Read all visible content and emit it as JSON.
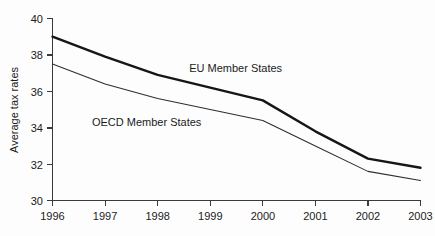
{
  "chart_data": {
    "type": "line",
    "title": "",
    "subtitle": "",
    "xlabel": "",
    "ylabel": "Average tax rates",
    "x": [
      1996,
      1997,
      1998,
      1999,
      2000,
      2001,
      2002,
      2003
    ],
    "x_ticklabels": [
      "1996",
      "1997",
      "1998",
      "1999",
      "2000",
      "2001",
      "2002",
      "2003"
    ],
    "y_ticklabels": [
      "30",
      "32",
      "34",
      "36",
      "38",
      "40"
    ],
    "y_ticks": [
      30,
      32,
      34,
      36,
      38,
      40
    ],
    "xlim": [
      1996,
      2003
    ],
    "ylim": [
      30,
      40
    ],
    "grid": false,
    "legend_position": "inline-annotations",
    "series": [
      {
        "name": "EU Member States",
        "label": "EU Member States",
        "color": "#161616",
        "line_width": "thick",
        "values": [
          39.0,
          37.9,
          36.9,
          36.2,
          35.5,
          33.8,
          32.3,
          31.8
        ],
        "label_x": 1998.6,
        "label_y": 37.05
      },
      {
        "name": "OECD Member States",
        "label": "OECD Member States",
        "color": "#2e2e2e",
        "line_width": "thin",
        "values": [
          37.5,
          36.4,
          35.6,
          35.0,
          34.4,
          33.0,
          31.6,
          31.1
        ],
        "label_x": 1996.75,
        "label_y": 34.1
      }
    ]
  },
  "axes": {
    "y_axis_title": "Average tax rates"
  }
}
